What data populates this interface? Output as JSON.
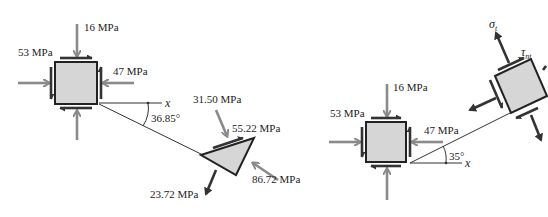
{
  "diagram": {
    "left_element": {
      "sigma_y": "16 MPa",
      "tau_xy": "53 MPa",
      "sigma_x": "47 MPa",
      "angle": "36.85°",
      "axis_label": "x"
    },
    "wedge": {
      "normal_stress": "86.72 MPa",
      "shear_stress": "55.22 MPa",
      "stress_component_1": "31.50 MPa",
      "stress_component_2": "23.72 MPa"
    },
    "right_element": {
      "sigma_y": "16 MPa",
      "tau_xy": "53 MPa",
      "sigma_x": "47 MPa",
      "angle": "35°",
      "axis_label": "x"
    },
    "rotated_element": {
      "sigma_label": "σ",
      "sigma_sub": "t",
      "tau_label": "τ",
      "tau_sub": "nt"
    },
    "colors": {
      "element_fill": "#d6d6d6",
      "applied_stress_arrow": "#8a8a8a",
      "result_arrow": "#333333"
    }
  }
}
